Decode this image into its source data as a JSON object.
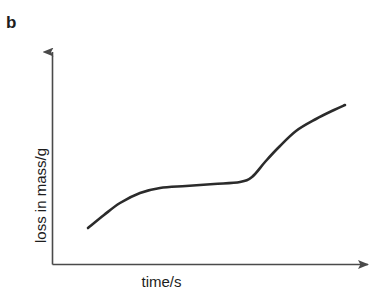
{
  "figure": {
    "panel_label": "b",
    "cropped_header_text": "",
    "background_color": "#ffffff",
    "curve_color": "#2b2b2b",
    "axis_color": "#4a4a4a",
    "text_color": "#1d1d1d"
  },
  "chart_data": {
    "type": "line",
    "title": "",
    "subtitle": "",
    "xlabel": "time/s",
    "ylabel": "loss in mass/g",
    "legend": [],
    "legend_position": "none",
    "grid": false,
    "ticks": {
      "x_tick_labels": [],
      "y_tick_labels": []
    },
    "axes_style": {
      "x_axis_arrow": true,
      "y_axis_arrow": true,
      "x_axis_pixel_y": 264,
      "y_axis_pixel_x": 52,
      "x_axis_from_px": 52,
      "x_axis_to_px": 375,
      "y_axis_from_px": 264,
      "y_axis_to_px": 45
    },
    "xlim": [
      0,
      1
    ],
    "ylim": [
      0,
      1
    ],
    "series": [
      {
        "name": "loss in mass",
        "description": "double-sigmoid: initial rise, plateau, second steeper rise, levelling off",
        "x": [
          0.11,
          0.16,
          0.21,
          0.27,
          0.33,
          0.41,
          0.5,
          0.58,
          0.62,
          0.66,
          0.7,
          0.75,
          0.81,
          0.87,
          0.91
        ],
        "y": [
          0.17,
          0.26,
          0.33,
          0.37,
          0.39,
          0.4,
          0.41,
          0.42,
          0.44,
          0.5,
          0.58,
          0.65,
          0.7,
          0.73,
          0.74
        ],
        "pixel_points": [
          [
            88,
            228
          ],
          [
            104,
            215
          ],
          [
            120,
            203
          ],
          [
            140,
            193
          ],
          [
            160,
            188
          ],
          [
            186,
            186
          ],
          [
            214,
            184
          ],
          [
            240,
            182
          ],
          [
            252,
            177
          ],
          [
            265,
            162
          ],
          [
            278,
            148
          ],
          [
            296,
            131
          ],
          [
            316,
            119
          ],
          [
            334,
            110
          ],
          [
            345,
            105
          ]
        ]
      }
    ]
  }
}
